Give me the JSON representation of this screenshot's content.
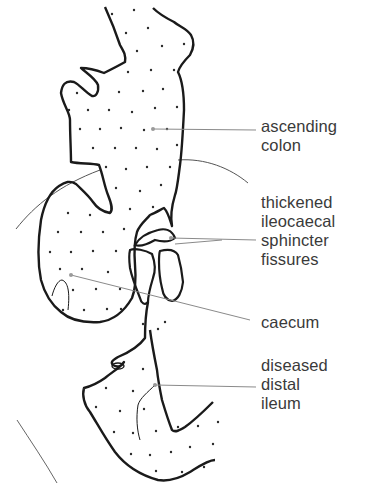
{
  "figure": {
    "type": "anatomical-diagram",
    "colors": {
      "outline": "#1a1a1a",
      "leader": "#8a8a8a",
      "dots": "#2a2a2a",
      "text": "#3a3a3a"
    }
  },
  "labels": [
    {
      "id": "ascending-colon",
      "lines": [
        "ascending",
        "colon"
      ],
      "top": 117
    },
    {
      "id": "thickened-sphincter",
      "lines": [
        "thickened",
        "ileocaecal",
        "sphincter",
        "fissures"
      ],
      "top": 193
    },
    {
      "id": "caecum",
      "lines": [
        "caecum"
      ],
      "top": 313
    },
    {
      "id": "diseased-ileum",
      "lines": [
        "diseased",
        "distal",
        "ileum"
      ],
      "top": 356
    }
  ]
}
